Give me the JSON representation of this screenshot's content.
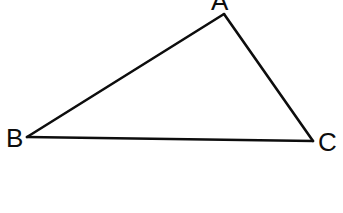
{
  "figure": {
    "kind": "geometry-diagram",
    "shape": "triangle",
    "background_color": "#ffffff",
    "stroke_color": "#0d0d0d",
    "stroke_width": 2.6,
    "canvas": {
      "width": 343,
      "height": 213
    },
    "vertices": [
      {
        "id": "A",
        "label": "A",
        "x": 224,
        "y": 14,
        "label_x": 211,
        "label_y": -12,
        "label_clipped_top": true
      },
      {
        "id": "B",
        "label": "B",
        "x": 27,
        "y": 137,
        "label_x": 6,
        "label_y": 125,
        "label_clipped_top": false
      },
      {
        "id": "C",
        "label": "C",
        "x": 313,
        "y": 141,
        "label_x": 318,
        "label_y": 129,
        "label_clipped_top": false
      }
    ],
    "edges": [
      {
        "id": "AB",
        "from": "A",
        "to": "B"
      },
      {
        "id": "BC",
        "from": "B",
        "to": "C"
      },
      {
        "id": "CA",
        "from": "C",
        "to": "A"
      }
    ],
    "path": "M 224 14 L 27 137 L 313 141 Z"
  },
  "labels": {
    "a": "A",
    "b": "B",
    "c": "C"
  }
}
